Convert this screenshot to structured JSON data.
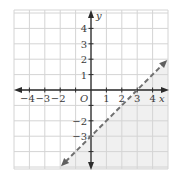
{
  "chart_data": {
    "type": "line",
    "title": "",
    "inequality": "y < x - 3",
    "boundary_line": {
      "equation": "y = x - 3",
      "slope": 1,
      "y_intercept": -3,
      "x_intercept": 3,
      "style": "dashed",
      "points": [
        [
          -2,
          -5
        ],
        [
          3,
          0
        ],
        [
          0,
          -3
        ],
        [
          5,
          2
        ]
      ]
    },
    "shaded_region": "below-right of line",
    "xlabel": "x",
    "ylabel": "y",
    "origin_label": "O",
    "xlim": [
      -5,
      5
    ],
    "ylim": [
      -5,
      5
    ],
    "grid": true,
    "x_tick_labels": [
      "-4",
      "-3",
      "-2",
      "1",
      "2",
      "3",
      "4"
    ],
    "y_tick_labels": [
      "4",
      "3",
      "2",
      "1",
      "-2",
      "-3"
    ],
    "colors": {
      "grid": "#d4d4d4",
      "axes": "#2b2b2b",
      "line": "#707070",
      "shade": "#f0f0f0"
    }
  },
  "labels": {
    "x_axis": "x",
    "y_axis": "y",
    "origin": "O",
    "x_ticks": [
      {
        "v": -4,
        "t": "−4"
      },
      {
        "v": -3,
        "t": "−3"
      },
      {
        "v": -2,
        "t": "−2"
      },
      {
        "v": 1,
        "t": "1"
      },
      {
        "v": 2,
        "t": "2"
      },
      {
        "v": 3,
        "t": "3"
      },
      {
        "v": 4,
        "t": "4"
      }
    ],
    "y_ticks": [
      {
        "v": 4,
        "t": "4"
      },
      {
        "v": 3,
        "t": "3"
      },
      {
        "v": 2,
        "t": "2"
      },
      {
        "v": 1,
        "t": "1"
      },
      {
        "v": -2,
        "t": "−2"
      },
      {
        "v": -3,
        "t": "−3"
      }
    ]
  }
}
